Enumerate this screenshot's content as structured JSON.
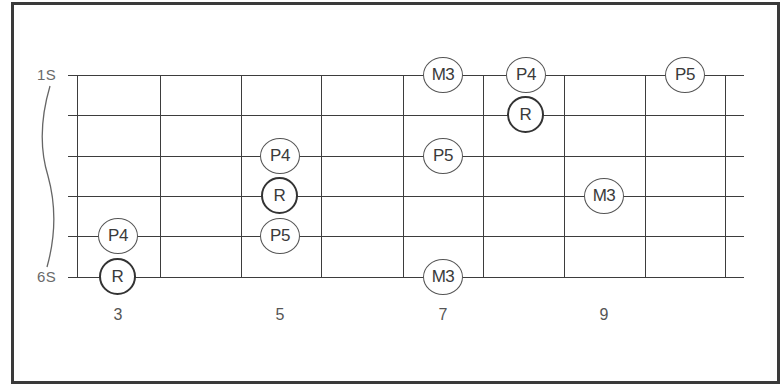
{
  "diagram": {
    "type": "guitar-fretboard-interval-map",
    "strings": [
      {
        "label": "1S",
        "y": 75
      },
      {
        "label": "",
        "y": 115
      },
      {
        "label": "",
        "y": 156
      },
      {
        "label": "",
        "y": 196
      },
      {
        "label": "",
        "y": 236
      },
      {
        "label": "6S",
        "y": 277
      }
    ],
    "fret_lines_x": [
      77,
      160,
      241,
      321,
      403,
      483,
      564,
      645,
      725
    ],
    "string_start_x": 68,
    "string_end_x": 744,
    "fret_numbers": [
      {
        "label": "3",
        "x": 118
      },
      {
        "label": "5",
        "x": 280
      },
      {
        "label": "7",
        "x": 443
      },
      {
        "label": "9",
        "x": 604
      }
    ],
    "notes": [
      {
        "label": "M3",
        "string": 1,
        "fret": 7,
        "x": 443,
        "root": false
      },
      {
        "label": "P4",
        "string": 1,
        "fret": 8,
        "x": 526,
        "root": false
      },
      {
        "label": "P5",
        "string": 1,
        "fret": 10,
        "x": 685,
        "root": false
      },
      {
        "label": "R",
        "string": 2,
        "fret": 8,
        "x": 526,
        "root": true
      },
      {
        "label": "P4",
        "string": 3,
        "fret": 5,
        "x": 280,
        "root": false
      },
      {
        "label": "P5",
        "string": 3,
        "fret": 7,
        "x": 443,
        "root": false
      },
      {
        "label": "R",
        "string": 4,
        "fret": 5,
        "x": 280,
        "root": true
      },
      {
        "label": "M3",
        "string": 4,
        "fret": 9,
        "x": 604,
        "root": false
      },
      {
        "label": "P4",
        "string": 5,
        "fret": 3,
        "x": 118,
        "root": false
      },
      {
        "label": "P5",
        "string": 5,
        "fret": 5,
        "x": 280,
        "root": false
      },
      {
        "label": "R",
        "string": 6,
        "fret": 3,
        "x": 118,
        "root": true
      },
      {
        "label": "M3",
        "string": 6,
        "fret": 7,
        "x": 443,
        "root": false
      }
    ],
    "colors": {
      "line": "#3d3d3d",
      "frame": "#3a3a3a",
      "label": "#6a6a6a",
      "note_text": "#3a3a3a"
    }
  }
}
